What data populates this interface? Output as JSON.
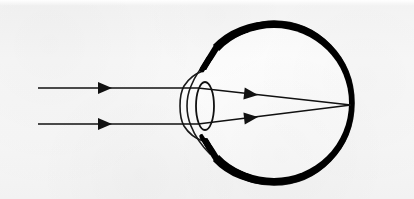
{
  "figure": {
    "width": 414,
    "height": 199,
    "background_color": "#fbfbfb",
    "ink_color": "#111111",
    "interior_color": "#ffffff"
  },
  "structures": {
    "sclera": {
      "name": "sclera",
      "label": "Sclera (thin outer outline)",
      "stroke_color": "#1a1a1a",
      "stroke_width": 1.6,
      "fill": "none"
    },
    "choroid_retina": {
      "name": "choroid-retina",
      "label": "Choroid / retina (thick black ring)",
      "stroke_color": "#000000",
      "stroke_width": 8,
      "fill": "none"
    },
    "vitreous": {
      "name": "vitreous-humour",
      "label": "Vitreous humour (white interior)",
      "fill_color": "#ffffff"
    },
    "cornea": {
      "name": "cornea",
      "label": "Cornea (anterior bulge, double outline)",
      "stroke_color": "#1a1a1a",
      "stroke_width": 1.6,
      "fill": "none"
    },
    "lens": {
      "name": "crystalline-lens",
      "label": "Crystalline lens (ellipse outline)",
      "stroke_color": "#111111",
      "stroke_width": 1.8,
      "fill": "none",
      "center_x": 205,
      "center_y": 106,
      "radius_x": 9,
      "radius_y": 24
    },
    "eyeball": {
      "name": "eyeball",
      "label": "Eyeball globe",
      "center_x": 274,
      "center_y": 103,
      "radius": 80
    },
    "focal_point": {
      "name": "focal-point",
      "label": "Focal point on retina",
      "x": 351,
      "y": 105
    }
  },
  "rays": {
    "label": "Incoming parallel light rays",
    "stroke_color": "#111111",
    "stroke_width": 1.6,
    "count": 2,
    "incoming": [
      {
        "name": "upper-incoming-ray",
        "start_x": 38,
        "start_y": 88,
        "end_x": 198,
        "end_y": 88
      },
      {
        "name": "lower-incoming-ray",
        "start_x": 38,
        "start_y": 124,
        "end_x": 198,
        "end_y": 124
      }
    ],
    "refracted": [
      {
        "name": "upper-refracted-ray",
        "start_x": 198,
        "start_y": 88,
        "end_x": 351,
        "end_y": 105
      },
      {
        "name": "lower-refracted-ray",
        "start_x": 198,
        "start_y": 124,
        "end_x": 351,
        "end_y": 105
      }
    ],
    "arrowheads": [
      {
        "name": "arrowhead-upper-incoming",
        "x": 112,
        "y": 88,
        "angle": 0
      },
      {
        "name": "arrowhead-lower-incoming",
        "x": 112,
        "y": 124,
        "angle": 0
      },
      {
        "name": "arrowhead-upper-refracted",
        "x": 258,
        "y": 95,
        "angle": 6.4
      },
      {
        "name": "arrowhead-lower-refracted",
        "x": 258,
        "y": 117,
        "angle": -6.4
      }
    ],
    "arrow_size": {
      "length": 14,
      "half_width": 6
    }
  }
}
